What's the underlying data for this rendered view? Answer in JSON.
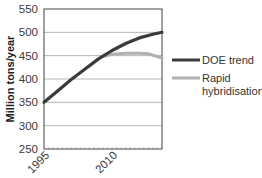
{
  "chart_data": {
    "type": "line",
    "title": "",
    "xlabel": "",
    "ylabel": "Million tons/year",
    "ylim": [
      250,
      550
    ],
    "yticks": [
      250,
      300,
      350,
      400,
      450,
      500,
      550
    ],
    "xlim": [
      1995,
      2021
    ],
    "xtick_labels": [
      "1995",
      "2010"
    ],
    "grid": "horizontal",
    "legend_position": "right",
    "series": [
      {
        "name": "DOE trend",
        "color": "#3a3a3a",
        "x": [
          1995,
          1998,
          2001,
          2004,
          2007,
          2010,
          2013,
          2016,
          2019,
          2021
        ],
        "values": [
          350,
          374,
          399,
          421,
          443,
          461,
          476,
          488,
          496,
          500
        ]
      },
      {
        "name": "Rapid hybridisation",
        "color": "#b0b0b0",
        "x": [
          2008,
          2010,
          2013,
          2016,
          2018,
          2021
        ],
        "values": [
          448,
          453,
          455,
          455,
          454,
          445
        ]
      }
    ]
  },
  "legend": {
    "items": [
      {
        "label_lines": [
          "DOE trend"
        ]
      },
      {
        "label_lines": [
          "Rapid",
          "hybridisation"
        ]
      }
    ]
  },
  "axis": {
    "y_title": "Million tons/year",
    "y_ticks": [
      "550",
      "500",
      "450",
      "400",
      "350",
      "300",
      "250"
    ],
    "x_ticks": [
      "1995",
      "2010"
    ]
  }
}
